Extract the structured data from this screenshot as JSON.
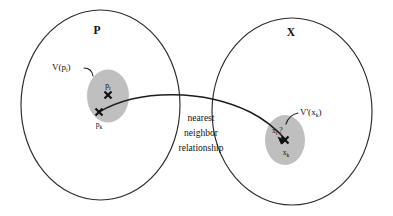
{
  "diagram": {
    "background_color": "#ffffff",
    "stroke_color": "#2b2b2b",
    "blob_color": "#bfbfbf",
    "sets": [
      {
        "id": "set-p",
        "label": "P",
        "cell_label_main": "V(",
        "cell_label_sub": "i",
        "cell_label_close": ")",
        "points": [
          {
            "id": "pi",
            "label_main": "p",
            "label_sub": "i"
          },
          {
            "id": "pk",
            "label_main": "p",
            "label_sub": "k"
          }
        ]
      },
      {
        "id": "set-x",
        "label": "X",
        "cell_label_main": "V'(",
        "cell_label_sub": "k",
        "cell_label_close": ")",
        "points": [
          {
            "id": "xi",
            "label_main": "x",
            "label_sub": "i",
            "suffix": " ?"
          },
          {
            "id": "xk",
            "label_main": "x",
            "label_sub": "k"
          }
        ]
      }
    ],
    "relation": {
      "line1": "nearest",
      "line2": "neighbor",
      "line3": "relationship"
    },
    "cell_label_p_prefix": "V(",
    "cell_label_p_var": "p",
    "cell_label_x_prefix": "V'(",
    "cell_label_x_var": "x"
  }
}
